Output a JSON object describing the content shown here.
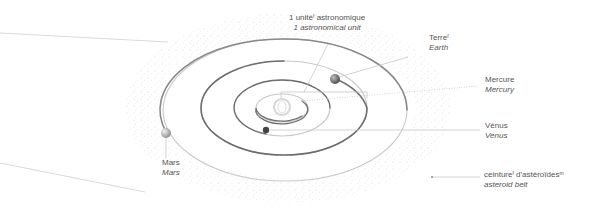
{
  "diagram": {
    "colors": {
      "background": "#ffffff",
      "orbit_light": "#cfcfcf",
      "orbit_dark": "#6e6e6e",
      "leader_line": "#c8c8c8",
      "label_text": "#555555",
      "asteroid_dots": "#d4d4d4"
    },
    "labels": {
      "au": {
        "fr": "1 unité",
        "fr_sup": "f",
        "fr_rest": " astronomique",
        "en": "1 astronomical unit"
      },
      "earth": {
        "fr": "Terre",
        "fr_sup": "f",
        "en": "Earth"
      },
      "mercury": {
        "fr": "Mercure",
        "en": "Mercury"
      },
      "venus": {
        "fr": "Vénus",
        "en": "Venus"
      },
      "mars": {
        "fr": "Mars",
        "en": "Mars"
      },
      "asteroid_belt": {
        "fr": "ceinture",
        "fr_sup": "f",
        "fr_mid": " d'astéroïdes",
        "fr_sup2": "m",
        "en": "asteroid belt"
      }
    },
    "bodies": [
      {
        "name": "Sun",
        "symbol": "sun-icon"
      },
      {
        "name": "Mercury",
        "symbol": "planet-icon"
      },
      {
        "name": "Venus",
        "symbol": "planet-icon"
      },
      {
        "name": "Earth",
        "symbol": "planet-icon"
      },
      {
        "name": "Mars",
        "symbol": "planet-icon"
      }
    ]
  }
}
